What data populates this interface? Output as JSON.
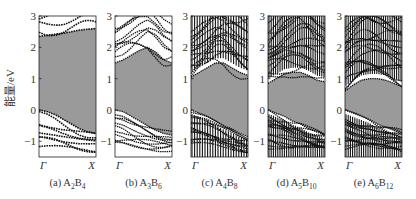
{
  "chart_data": {
    "type": "line",
    "title": "",
    "ylabel": "能量/eV",
    "xlabel": "",
    "ylim": [
      -1.5,
      3.0
    ],
    "yticks": [
      3,
      2,
      1,
      0,
      -1
    ],
    "ytick_labels": [
      "3",
      "2",
      "1",
      "0",
      "−1"
    ],
    "x_kpoints": [
      "Γ",
      "X"
    ],
    "gap_fill_color": "#9a9a9a",
    "band_color": "#111111",
    "panels": [
      {
        "id": "a",
        "caption_prefix": "(a) ",
        "formula": [
          {
            "t": "A"
          },
          {
            "s": "2"
          },
          {
            "t": "B"
          },
          {
            "s": "4"
          }
        ],
        "cbm": [
          2.35,
          2.38,
          2.42,
          2.45,
          2.5,
          2.55,
          2.58,
          2.6
        ],
        "vbm": [
          0.0,
          -0.05,
          -0.15,
          -0.3,
          -0.45,
          -0.6,
          -0.7,
          -0.75
        ],
        "n_conduction_lines": 3,
        "n_valence_lines": 7,
        "density": "sparse"
      },
      {
        "id": "b",
        "caption_prefix": "(b) ",
        "formula": [
          {
            "t": "A"
          },
          {
            "s": "3"
          },
          {
            "t": "B"
          },
          {
            "s": "6"
          }
        ],
        "cbm": [
          1.5,
          1.6,
          1.75,
          1.9,
          2.0,
          1.85,
          1.6,
          1.5
        ],
        "vbm": [
          0.0,
          -0.05,
          -0.2,
          -0.35,
          -0.5,
          -0.65,
          -0.75,
          -0.8
        ],
        "n_conduction_lines": 9,
        "n_valence_lines": 10,
        "density": "medium"
      },
      {
        "id": "c",
        "caption_prefix": "(c) ",
        "formula": [
          {
            "t": "A"
          },
          {
            "s": "4"
          },
          {
            "t": "B"
          },
          {
            "s": "8"
          }
        ],
        "cbm": [
          1.05,
          1.2,
          1.35,
          1.5,
          1.5,
          1.35,
          1.2,
          1.1
        ],
        "vbm": [
          0.0,
          -0.1,
          -0.2,
          -0.35,
          -0.5,
          -0.6,
          -0.75,
          -0.85
        ],
        "n_conduction_lines": 14,
        "n_valence_lines": 12,
        "density": "dense"
      },
      {
        "id": "d",
        "caption_prefix": "(d) ",
        "formula": [
          {
            "t": "A"
          },
          {
            "s": "5"
          },
          {
            "t": "B"
          },
          {
            "s": "10"
          }
        ],
        "cbm": [
          0.85,
          1.0,
          1.15,
          1.2,
          1.2,
          1.1,
          0.95,
          0.9
        ],
        "vbm": [
          0.0,
          -0.1,
          -0.2,
          -0.35,
          -0.45,
          -0.6,
          -0.7,
          -0.8
        ],
        "n_conduction_lines": 16,
        "n_valence_lines": 14,
        "density": "very-dense"
      },
      {
        "id": "e",
        "caption_prefix": "(e) ",
        "formula": [
          {
            "t": "A"
          },
          {
            "s": "6"
          },
          {
            "t": "B"
          },
          {
            "s": "12"
          }
        ],
        "cbm": [
          0.6,
          0.8,
          0.95,
          1.0,
          1.0,
          0.95,
          0.85,
          0.75
        ],
        "vbm": [
          0.0,
          -0.1,
          -0.2,
          -0.3,
          -0.45,
          -0.55,
          -0.65,
          -0.75
        ],
        "n_conduction_lines": 18,
        "n_valence_lines": 15,
        "density": "very-dense"
      }
    ]
  }
}
